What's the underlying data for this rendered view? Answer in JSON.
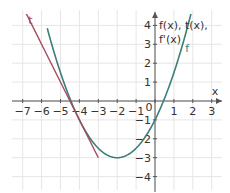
{
  "chart_data": {
    "type": "line",
    "title": "",
    "xlabel": "x",
    "ylabel": "f(x), t(x), f'(x)",
    "xlim": [
      -7.5,
      3.5
    ],
    "ylim": [
      -4.5,
      4.5
    ],
    "grid": true,
    "x_ticks": [
      -7,
      -6,
      -5,
      -4,
      -3,
      -2,
      -1,
      0,
      1,
      2,
      3
    ],
    "x_tick_labels": [
      "−7",
      "−6",
      "−5",
      "−4",
      "−3",
      "−2",
      "−1",
      "0",
      "1",
      "2",
      "3"
    ],
    "y_ticks": [
      4,
      3,
      2,
      1,
      -1,
      -2,
      -3,
      -4
    ],
    "y_tick_labels": [
      "4",
      "3",
      "2",
      "1",
      "−1",
      "−2",
      "−3",
      "−4"
    ],
    "series": [
      {
        "name": "f",
        "color": "#3a7f7a",
        "formula": "f(x) = 0.5x^2 + 2x - 1",
        "x": [
          -5.6,
          -5,
          -4.5,
          -4,
          -3,
          -2,
          -1,
          0,
          0.5,
          1,
          1.5,
          1.9
        ],
        "values": [
          3.48,
          1.5,
          0.125,
          -1,
          -2.5,
          -3,
          -2.5,
          -1,
          0.125,
          1.5,
          3.125,
          4.6
        ]
      },
      {
        "name": "t",
        "color": "#a8485e",
        "formula": "t(x) = -2x - 9",
        "x": [
          -6.9,
          -6,
          -5,
          -4,
          -3
        ],
        "values": [
          4.8,
          3,
          1,
          -1,
          -3
        ]
      }
    ],
    "annotations": [
      {
        "text": "t",
        "x": -6.7,
        "y": 4.1,
        "color": "#a8485e"
      },
      {
        "text": "f",
        "x": 1.6,
        "y": 2.6,
        "color": "#3a7f7a"
      }
    ],
    "axis_labels": {
      "x": "x",
      "y_line1": "f(x), t(x),",
      "y_line2": "f'(x)"
    }
  }
}
